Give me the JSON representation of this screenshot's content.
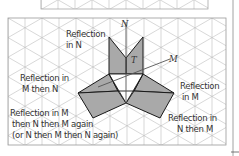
{
  "diagram": {
    "type": "reflection-symmetry-isometric-grid",
    "colors": {
      "grid": "#b8b8b8",
      "frame": "#9a9a9a",
      "shape_fill": "#a9a9a9",
      "shape_outline": "#1a1a1a",
      "mirror_line": "#555555",
      "text": "#333333"
    },
    "mirror_lines": {
      "n": "N",
      "m": "M"
    },
    "shape_label": "T",
    "labels": {
      "refl_n_line1": "Reflection",
      "refl_n_line2": "in N",
      "refl_mn_line1": "Reflection in",
      "refl_mn_line2": "M then N",
      "refl_mnm_line1": "Reflection in M",
      "refl_mnm_line2": "then N then M again",
      "refl_mnm_line3": "(or N then M then N again)",
      "refl_m_line1": "Reflection",
      "refl_m_line2": "in M",
      "refl_nm_line1": "Reflection in",
      "refl_nm_line2": "N then M"
    }
  }
}
